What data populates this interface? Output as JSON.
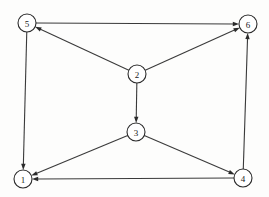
{
  "diagram": {
    "type": "directed-graph",
    "canvas": {
      "width": 269,
      "height": 197
    },
    "style": {
      "background_color": "#fdfdfc",
      "node_fill": "#ffffff",
      "node_stroke": "#2b2b2b",
      "edge_color": "#3a3a3a",
      "label_color": "#1a1a1a",
      "node_radius": 9
    },
    "nodes": [
      {
        "id": "1",
        "label": "1",
        "x": 23,
        "y": 179
      },
      {
        "id": "2",
        "label": "2",
        "x": 137,
        "y": 74
      },
      {
        "id": "3",
        "label": "3",
        "x": 136,
        "y": 132
      },
      {
        "id": "4",
        "label": "4",
        "x": 243,
        "y": 178
      },
      {
        "id": "5",
        "label": "5",
        "x": 27,
        "y": 23
      },
      {
        "id": "6",
        "label": "6",
        "x": 248,
        "y": 24
      }
    ],
    "edges": [
      {
        "from": "5",
        "to": "6",
        "directed": true
      },
      {
        "from": "5",
        "to": "1",
        "directed": true
      },
      {
        "from": "2",
        "to": "5",
        "directed": true
      },
      {
        "from": "2",
        "to": "6",
        "directed": true
      },
      {
        "from": "2",
        "to": "3",
        "directed": true
      },
      {
        "from": "3",
        "to": "1",
        "directed": true
      },
      {
        "from": "3",
        "to": "4",
        "directed": true
      },
      {
        "from": "4",
        "to": "6",
        "directed": true
      },
      {
        "from": "4",
        "to": "1",
        "directed": true
      }
    ]
  }
}
